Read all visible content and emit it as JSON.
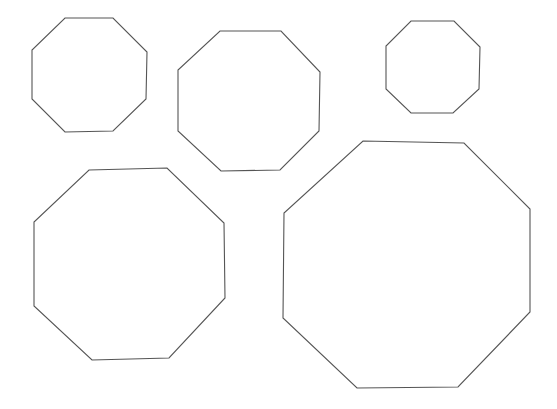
{
  "canvas": {
    "width": 557,
    "height": 409,
    "background": "#ffffff",
    "stroke_color": "#555555"
  },
  "shapes": [
    {
      "id": "octagon-1",
      "type": "octagon",
      "size": "small",
      "points": "65,18 113,18 147,52 146,99 113,131 65,132 32,99 32,50"
    },
    {
      "id": "octagon-2",
      "type": "octagon",
      "size": "medium",
      "points": "220,31 281,31 320,72 319,131 280,170 221,171 178,131 178,70"
    },
    {
      "id": "octagon-3",
      "type": "octagon",
      "size": "smallest",
      "points": "411,21 454,21 480,47 479,89 453,113 411,113 386,89 386,46"
    },
    {
      "id": "octagon-4",
      "type": "octagon",
      "size": "large",
      "points": "89,170 167,168 224,223 225,298 169,358 92,360 34,306 34,222"
    },
    {
      "id": "octagon-5",
      "type": "octagon",
      "size": "largest",
      "points": "363,141 464,143 530,209 530,312 458,387 357,388 283,318 284,213"
    }
  ]
}
